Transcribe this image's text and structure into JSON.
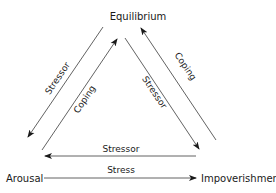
{
  "diagram": {
    "nodes": {
      "top": "Equilibrium",
      "left": "Arousal",
      "right": "Impoverishment"
    },
    "edges": [
      {
        "id": "eq-to-arousal",
        "from": "Equilibrium",
        "to": "Arousal",
        "label": "Stressor"
      },
      {
        "id": "arousal-to-eq",
        "from": "Arousal",
        "to": "Equilibrium",
        "label": "Coping"
      },
      {
        "id": "eq-to-impov",
        "from": "Equilibrium",
        "to": "Impoverishment",
        "label": "Stressor"
      },
      {
        "id": "impov-to-eq",
        "from": "Impoverishment",
        "to": "Equilibrium",
        "label": "Coping"
      },
      {
        "id": "impov-to-arousal",
        "from": "Impoverishment",
        "to": "Arousal",
        "label": "Stressor"
      },
      {
        "id": "arousal-to-impov",
        "from": "Arousal",
        "to": "Impoverishment",
        "label": "Stress"
      }
    ]
  }
}
